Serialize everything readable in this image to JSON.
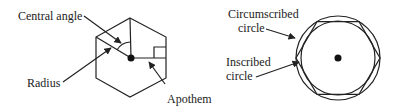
{
  "figure": {
    "left_diagram": {
      "title": "Regular hexagon parts",
      "labels": {
        "central_angle": "Central angle",
        "radius": "Radius",
        "apothem": "Apothem"
      }
    },
    "right_diagram": {
      "title": "Circumscribed and inscribed circles",
      "labels": {
        "circumscribed_line1": "Circumscribed",
        "circumscribed_line2": "circle",
        "inscribed_line1": "Inscribed",
        "inscribed_line2": "circle"
      }
    },
    "colors": {
      "stroke": "#222222",
      "background": "#ffffff"
    }
  }
}
